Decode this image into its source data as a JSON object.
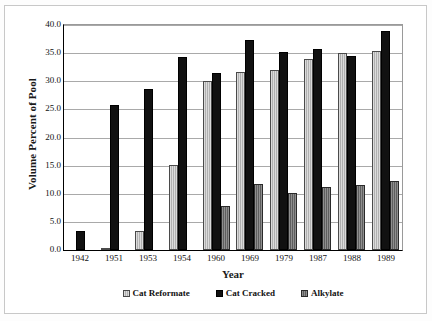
{
  "chart_data": {
    "type": "bar",
    "title": "",
    "xlabel": "Year",
    "ylabel": "Volume Percent of Pool",
    "categories": [
      "1942",
      "1951",
      "1953",
      "1954",
      "1960",
      "1969",
      "1979",
      "1987",
      "1988",
      "1989"
    ],
    "series": [
      {
        "name": "Cat Reformate",
        "color": "#b0b0b0",
        "values": [
          0.0,
          0.3,
          3.4,
          15.1,
          30.0,
          31.6,
          32.0,
          34.0,
          35.0,
          35.3
        ]
      },
      {
        "name": "Cat Cracked",
        "color": "#111111",
        "values": [
          3.4,
          25.7,
          28.6,
          34.4,
          31.4,
          37.3,
          35.2,
          35.7,
          34.5,
          38.9
        ]
      },
      {
        "name": "Alkylate",
        "color": "#5e5e5e",
        "values": [
          0.0,
          0.0,
          0.0,
          0.0,
          7.8,
          11.8,
          10.2,
          11.2,
          11.6,
          12.3
        ]
      }
    ],
    "ylim": [
      0.0,
      40.0
    ],
    "ytick_labels": [
      "40.0",
      "35.0",
      "30.0",
      "25.0",
      "20.0",
      "15.0",
      "10.0",
      "5.0",
      "0.0"
    ],
    "ytick_values": [
      40.0,
      35.0,
      30.0,
      25.0,
      20.0,
      15.0,
      10.0,
      5.0,
      0.0
    ],
    "grid": true,
    "legend_position": "bottom"
  },
  "legend": {
    "entries": [
      {
        "label": "Cat Reformate"
      },
      {
        "label": "Cat Cracked"
      },
      {
        "label": "Alkylate"
      }
    ]
  }
}
